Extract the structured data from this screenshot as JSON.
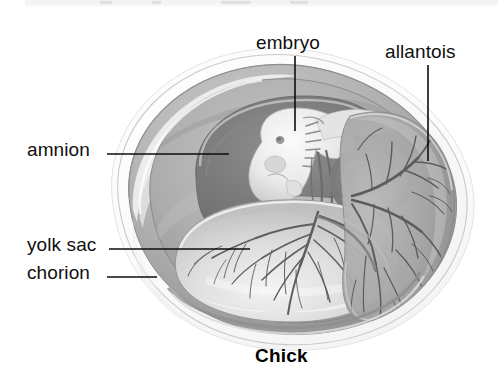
{
  "figure": {
    "caption": "Chick",
    "background_color": "#ffffff",
    "ink_color": "#101010"
  },
  "labels": [
    {
      "id": "embryo",
      "text": "embryo",
      "text_x": 256,
      "text_y": 33,
      "leader": {
        "orientation": "vertical",
        "x": 295,
        "y1": 56,
        "y2": 131
      }
    },
    {
      "id": "allantois",
      "text": "allantois",
      "text_x": 385,
      "text_y": 42,
      "leader": {
        "orientation": "vertical",
        "x": 428,
        "y1": 65,
        "y2": 161
      }
    },
    {
      "id": "amnion",
      "text": "amnion",
      "text_x": 27,
      "text_y": 140,
      "leader": {
        "orientation": "horizontal",
        "y": 154,
        "x1": 107,
        "x2": 229
      }
    },
    {
      "id": "yolk-sac",
      "text": "yolk sac",
      "text_x": 27,
      "text_y": 235,
      "leader": {
        "orientation": "horizontal",
        "y": 249,
        "x1": 109,
        "x2": 250
      }
    },
    {
      "id": "chorion",
      "text": "chorion",
      "text_x": 27,
      "text_y": 263,
      "leader": {
        "orientation": "horizontal",
        "y": 277,
        "x1": 107,
        "x2": 157
      }
    }
  ],
  "structures": [
    {
      "id": "shell",
      "name": "shell"
    },
    {
      "id": "chorion",
      "name": "chorion"
    },
    {
      "id": "allantois",
      "name": "allantois"
    },
    {
      "id": "yolk-sac",
      "name": "yolk sac"
    },
    {
      "id": "amnion",
      "name": "amnion"
    },
    {
      "id": "embryo",
      "name": "embryo"
    }
  ],
  "palette": {
    "shell_outer": "#f6f6f6",
    "shell_rim": "#fdfdfd",
    "chorion": "#b9b9b9",
    "chorion_dark": "#9a9a9a",
    "amnion_cavity": "#8c8c8c",
    "amnion_wall": "#a6a6a6",
    "allantois": "#a2a2a2",
    "yolk_sac": "#dcdcdc",
    "yolk_sac_light": "#f1f1f1",
    "embryo": "#eeeeee",
    "vessel": "#5f5f5f",
    "outline": "#6e6e6e"
  }
}
